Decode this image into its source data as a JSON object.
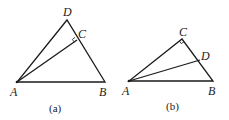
{
  "figures": [
    {
      "id": "a",
      "caption": "(a)",
      "points": {
        "A": {
          "label": "A",
          "x": 17,
          "y": 82
        },
        "B": {
          "label": "B",
          "x": 105,
          "y": 82
        },
        "D": {
          "label": "D",
          "x": 67,
          "y": 20
        },
        "C": {
          "label": "C",
          "x": 77,
          "y": 40
        }
      },
      "segments": [
        "AB",
        "AD",
        "DB",
        "AC"
      ],
      "right_angle_at": "C"
    },
    {
      "id": "b",
      "caption": "(b)",
      "points": {
        "A": {
          "label": "A",
          "x": 129,
          "y": 81
        },
        "B": {
          "label": "B",
          "x": 213,
          "y": 81
        },
        "C": {
          "label": "C",
          "x": 182,
          "y": 39
        },
        "D": {
          "label": "D",
          "x": 200,
          "y": 60
        }
      },
      "segments": [
        "AB",
        "AC",
        "CB",
        "AD"
      ],
      "right_angle_at": "C"
    }
  ]
}
